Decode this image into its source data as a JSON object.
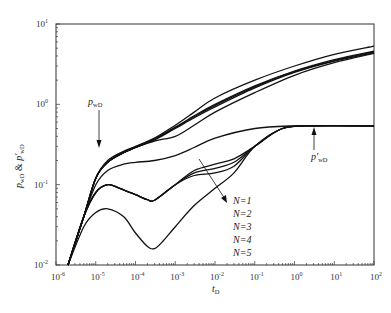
{
  "chart_data": {
    "type": "line",
    "title": "",
    "xlabel": "t_D",
    "ylabel": "p_wD & p'_wD",
    "xscale": "log",
    "yscale": "log",
    "xlim": [
      1e-06,
      100
    ],
    "ylim": [
      0.01,
      10
    ],
    "grid": false,
    "x_ticks": [
      "10^-6",
      "10^-5",
      "10^-4",
      "10^-3",
      "10^-2",
      "10^-1",
      "10^0",
      "10^1",
      "10^2"
    ],
    "y_ticks": [
      "10^-2",
      "10^-1",
      "10^0",
      "10^1"
    ],
    "annotations": [
      {
        "text": "p_wD",
        "points_to": "pressure curves",
        "at": [
          1.2e-05,
          0.23
        ]
      },
      {
        "text": "p'_wD",
        "points_to": "derivative plateau",
        "at": [
          4,
          0.54
        ]
      },
      {
        "text": "N=1",
        "legend_group": "arrow direction of increasing N"
      },
      {
        "text": "N=2"
      },
      {
        "text": "N=3"
      },
      {
        "text": "N=4"
      },
      {
        "text": "N=5"
      }
    ],
    "series": [
      {
        "name": "p_wD N=1",
        "group": "pressure",
        "points": [
          [
            2e-06,
            0.01
          ],
          [
            5e-06,
            0.04
          ],
          [
            1e-05,
            0.12
          ],
          [
            2e-05,
            0.2
          ],
          [
            5e-05,
            0.26
          ],
          [
            0.0001,
            0.3
          ],
          [
            0.0003,
            0.38
          ],
          [
            0.001,
            0.55
          ],
          [
            0.003,
            0.8
          ],
          [
            0.01,
            1.2
          ],
          [
            0.1,
            2.0
          ],
          [
            1,
            3.0
          ],
          [
            10,
            4.2
          ],
          [
            100,
            5.3
          ]
        ]
      },
      {
        "name": "p_wD N=2",
        "group": "pressure",
        "points": [
          [
            2e-06,
            0.01
          ],
          [
            5e-06,
            0.04
          ],
          [
            1e-05,
            0.12
          ],
          [
            2e-05,
            0.19
          ],
          [
            5e-05,
            0.25
          ],
          [
            0.0001,
            0.29
          ],
          [
            0.0003,
            0.37
          ],
          [
            0.001,
            0.52
          ],
          [
            0.003,
            0.72
          ],
          [
            0.01,
            1.0
          ],
          [
            0.1,
            1.7
          ],
          [
            1,
            2.6
          ],
          [
            10,
            3.6
          ],
          [
            100,
            4.6
          ]
        ]
      },
      {
        "name": "p_wD N=3",
        "group": "pressure",
        "points": [
          [
            2e-06,
            0.01
          ],
          [
            5e-06,
            0.04
          ],
          [
            1e-05,
            0.12
          ],
          [
            2e-05,
            0.19
          ],
          [
            5e-05,
            0.25
          ],
          [
            0.0001,
            0.29
          ],
          [
            0.0003,
            0.37
          ],
          [
            0.001,
            0.51
          ],
          [
            0.003,
            0.7
          ],
          [
            0.01,
            0.97
          ],
          [
            0.1,
            1.65
          ],
          [
            1,
            2.55
          ],
          [
            10,
            3.5
          ],
          [
            100,
            4.5
          ]
        ]
      },
      {
        "name": "p_wD N=4",
        "group": "pressure",
        "points": [
          [
            2e-06,
            0.01
          ],
          [
            5e-06,
            0.04
          ],
          [
            1e-05,
            0.12
          ],
          [
            2e-05,
            0.19
          ],
          [
            5e-05,
            0.25
          ],
          [
            0.0001,
            0.29
          ],
          [
            0.0003,
            0.36
          ],
          [
            0.001,
            0.5
          ],
          [
            0.003,
            0.68
          ],
          [
            0.01,
            0.93
          ],
          [
            0.1,
            1.6
          ],
          [
            1,
            2.5
          ],
          [
            10,
            3.45
          ],
          [
            100,
            4.4
          ]
        ]
      },
      {
        "name": "p_wD N=5",
        "group": "pressure",
        "points": [
          [
            2e-06,
            0.01
          ],
          [
            5e-06,
            0.04
          ],
          [
            1e-05,
            0.12
          ],
          [
            2e-05,
            0.19
          ],
          [
            5e-05,
            0.25
          ],
          [
            0.0001,
            0.29
          ],
          [
            0.0003,
            0.35
          ],
          [
            0.001,
            0.4
          ],
          [
            0.003,
            0.55
          ],
          [
            0.01,
            0.8
          ],
          [
            0.1,
            1.4
          ],
          [
            1,
            2.3
          ],
          [
            10,
            3.3
          ],
          [
            100,
            4.3
          ]
        ]
      },
      {
        "name": "p'_wD N=1",
        "group": "derivative",
        "points": [
          [
            2e-06,
            0.01
          ],
          [
            5e-06,
            0.04
          ],
          [
            1e-05,
            0.1
          ],
          [
            2e-05,
            0.15
          ],
          [
            5e-05,
            0.18
          ],
          [
            0.0001,
            0.19
          ],
          [
            0.0003,
            0.2
          ],
          [
            0.001,
            0.23
          ],
          [
            0.003,
            0.29
          ],
          [
            0.01,
            0.38
          ],
          [
            0.1,
            0.5
          ],
          [
            1,
            0.54
          ],
          [
            10,
            0.54
          ],
          [
            100,
            0.54
          ]
        ]
      },
      {
        "name": "p'_wD N=2",
        "group": "derivative",
        "points": [
          [
            2e-06,
            0.01
          ],
          [
            5e-06,
            0.04
          ],
          [
            1e-05,
            0.08
          ],
          [
            2e-05,
            0.1
          ],
          [
            4e-05,
            0.09
          ],
          [
            0.0001,
            0.075
          ],
          [
            0.0002,
            0.065
          ],
          [
            0.0003,
            0.064
          ],
          [
            0.001,
            0.1
          ],
          [
            0.003,
            0.15
          ],
          [
            0.01,
            0.18
          ],
          [
            0.03,
            0.21
          ],
          [
            0.1,
            0.3
          ],
          [
            0.5,
            0.5
          ],
          [
            3,
            0.54
          ],
          [
            100,
            0.54
          ]
        ]
      },
      {
        "name": "p'_wD N=3",
        "group": "derivative",
        "points": [
          [
            2e-06,
            0.01
          ],
          [
            5e-06,
            0.04
          ],
          [
            1e-05,
            0.08
          ],
          [
            2e-05,
            0.1
          ],
          [
            4e-05,
            0.09
          ],
          [
            0.0001,
            0.075
          ],
          [
            0.0002,
            0.065
          ],
          [
            0.0003,
            0.064
          ],
          [
            0.001,
            0.1
          ],
          [
            0.003,
            0.14
          ],
          [
            0.01,
            0.16
          ],
          [
            0.03,
            0.19
          ],
          [
            0.1,
            0.3
          ],
          [
            0.5,
            0.5
          ],
          [
            3,
            0.54
          ],
          [
            100,
            0.54
          ]
        ]
      },
      {
        "name": "p'_wD N=4",
        "group": "derivative",
        "points": [
          [
            2e-06,
            0.01
          ],
          [
            5e-06,
            0.04
          ],
          [
            1e-05,
            0.08
          ],
          [
            2e-05,
            0.1
          ],
          [
            4e-05,
            0.09
          ],
          [
            0.0001,
            0.075
          ],
          [
            0.0002,
            0.065
          ],
          [
            0.0003,
            0.064
          ],
          [
            0.001,
            0.1
          ],
          [
            0.003,
            0.13
          ],
          [
            0.01,
            0.14
          ],
          [
            0.03,
            0.17
          ],
          [
            0.1,
            0.3
          ],
          [
            0.5,
            0.5
          ],
          [
            3,
            0.54
          ],
          [
            100,
            0.54
          ]
        ]
      },
      {
        "name": "p'_wD N=5",
        "group": "derivative",
        "points": [
          [
            2e-06,
            0.01
          ],
          [
            5e-06,
            0.03
          ],
          [
            1e-05,
            0.045
          ],
          [
            2e-05,
            0.05
          ],
          [
            5e-05,
            0.04
          ],
          [
            0.0001,
            0.025
          ],
          [
            0.0002,
            0.017
          ],
          [
            0.0003,
            0.016
          ],
          [
            0.0005,
            0.02
          ],
          [
            0.001,
            0.03
          ],
          [
            0.003,
            0.055
          ],
          [
            0.01,
            0.09
          ],
          [
            0.03,
            0.14
          ],
          [
            0.1,
            0.3
          ],
          [
            0.5,
            0.5
          ],
          [
            3,
            0.54
          ],
          [
            100,
            0.54
          ]
        ]
      }
    ]
  },
  "labels": {
    "x_axis_label": "t",
    "x_axis_sub": "D",
    "y_axis_label_a": "p",
    "y_axis_sub_a": "wD",
    "y_axis_amp": " & ",
    "y_axis_label_b": "p'",
    "y_axis_sub_b": "wD",
    "ann_pwd": "p",
    "ann_pwd_sub": "wD",
    "ann_dpwd": "p'",
    "ann_dpwd_sub": "wD",
    "n_labels": [
      "N=1",
      "N=2",
      "N=3",
      "N=4",
      "N=5"
    ]
  },
  "colors": {
    "line": "#111111",
    "axis": "#333333"
  }
}
